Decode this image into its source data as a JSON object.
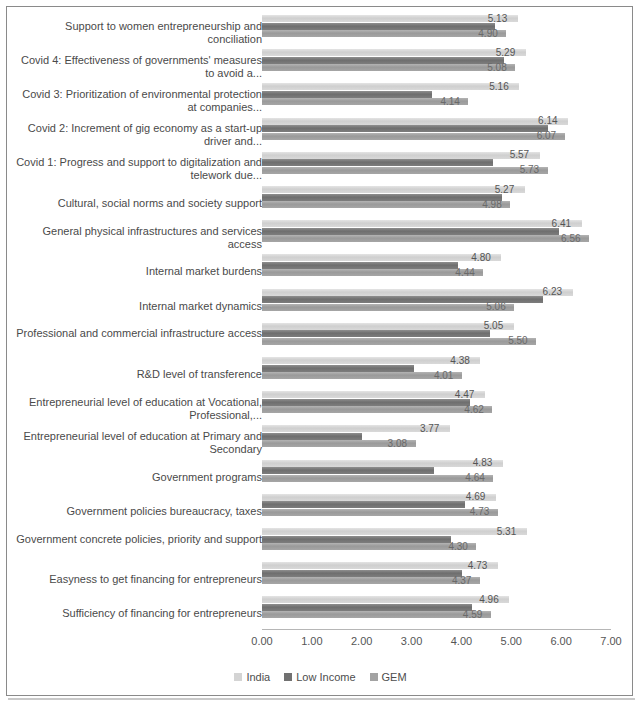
{
  "chart_data": {
    "type": "bar",
    "orientation": "horizontal",
    "title": "",
    "xlabel": "",
    "ylabel": "",
    "xlim": [
      0,
      7
    ],
    "xticks": [
      "0.00",
      "1.00",
      "2.00",
      "3.00",
      "4.00",
      "5.00",
      "6.00",
      "7.00"
    ],
    "grid": false,
    "legend_position": "bottom",
    "series_order": [
      "India",
      "Low Income",
      "GEM"
    ],
    "categories": [
      "Support to women entrepreneurship and conciliation",
      "Covid 4: Effectiveness of governments' measures to avoid a...",
      "Covid 3: Prioritization of environmental protection at companies...",
      "Covid 2: Increment of gig economy as a start-up driver and...",
      "Covid 1: Progress and support to digitalization and telework due...",
      "Cultural, social norms and society support",
      "General physical infrastructures and services access",
      "Internal market burdens",
      "Internal market dynamics",
      "Professional and commercial infrastructure access",
      "R&D level of transference",
      "Entrepreneurial level of education at Vocational, Professional,...",
      "Entrepreneurial level of education at Primary and Secondary",
      "Government programs",
      "Government policies bureaucracy, taxes",
      "Government concrete policies, priority and support",
      "Easyness to get financing for entrepreneurs",
      "Sufficiency of financing for entrepreneurs"
    ],
    "series": [
      {
        "name": "India",
        "color": "#d4d4d4",
        "values": [
          5.13,
          5.29,
          5.16,
          6.14,
          5.57,
          5.27,
          6.41,
          4.8,
          6.23,
          5.05,
          4.38,
          4.47,
          3.77,
          4.83,
          4.69,
          5.31,
          4.73,
          4.96
        ],
        "labels": [
          "5.13",
          "5.29",
          "5.16",
          "6.14",
          "5.57",
          "5.27",
          "6.41",
          "4.80",
          "6.23",
          "5.05",
          "4.38",
          "4.47",
          "3.77",
          "4.83",
          "4.69",
          "5.31",
          "4.73",
          "4.96"
        ]
      },
      {
        "name": "Low Income",
        "color": "#717171",
        "values": [
          4.67,
          4.86,
          3.41,
          5.74,
          4.63,
          4.82,
          5.96,
          3.93,
          5.64,
          4.58,
          3.04,
          4.17,
          2.01,
          3.44,
          4.08,
          3.79,
          4.02,
          4.21
        ],
        "labels": [
          "",
          "",
          "",
          "",
          "",
          "",
          "",
          "",
          "",
          "",
          "",
          "",
          "",
          "",
          "",
          "",
          "",
          ""
        ]
      },
      {
        "name": "GEM",
        "color": "#a3a3a3",
        "values": [
          4.9,
          5.08,
          4.14,
          6.07,
          5.73,
          4.98,
          6.56,
          4.44,
          5.06,
          5.5,
          4.01,
          4.62,
          3.08,
          4.64,
          4.73,
          4.3,
          4.37,
          4.59
        ],
        "labels": [
          "4.90",
          "5.08",
          "4.14",
          "6.07",
          "5.73",
          "4.98",
          "6.56",
          "4.44",
          "5.06",
          "5.50",
          "4.01",
          "4.62",
          "3.08",
          "4.64",
          "4.73",
          "4.30",
          "4.37",
          "4.59"
        ]
      }
    ]
  },
  "legend": {
    "items": [
      {
        "label": "India",
        "swatch": "s-india"
      },
      {
        "label": "Low Income",
        "swatch": "s-low"
      },
      {
        "label": "GEM",
        "swatch": "s-gem"
      }
    ]
  }
}
